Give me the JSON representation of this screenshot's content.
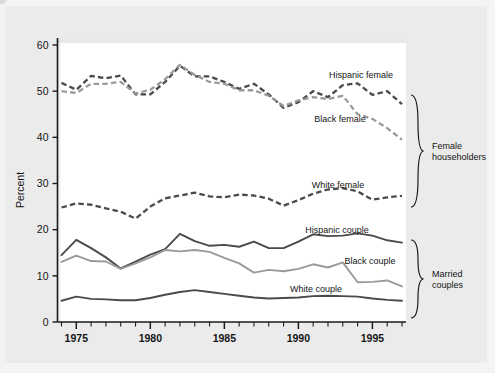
{
  "chart_data": {
    "type": "line",
    "title": "",
    "xlabel": "",
    "ylabel": "Percent",
    "xlim": [
      1974,
      1997
    ],
    "ylim": [
      0,
      62
    ],
    "yticks": [
      0,
      10,
      20,
      30,
      40,
      50,
      60
    ],
    "xticks": [
      1975,
      1980,
      1985,
      1990,
      1995
    ],
    "xtick_labels": [
      "1975",
      "1980",
      "1985",
      "1990",
      "1995"
    ],
    "ytick_labels": [
      "0",
      "10",
      "20",
      "30",
      "40",
      "50",
      "60"
    ],
    "minor_xticks_every": 1,
    "grid": false,
    "legend_position": "inline-annotations",
    "x": [
      1974,
      1975,
      1976,
      1977,
      1978,
      1979,
      1980,
      1981,
      1982,
      1983,
      1984,
      1985,
      1986,
      1987,
      1988,
      1989,
      1990,
      1991,
      1992,
      1993,
      1994,
      1995,
      1996,
      1997
    ],
    "series": [
      {
        "name": "Hispanic female",
        "style": "dashed",
        "color": "#4a4a4a",
        "values": [
          51.8,
          50.3,
          53.3,
          52.8,
          53.4,
          49.3,
          49.3,
          52.0,
          55.5,
          53.2,
          53.2,
          52.0,
          50.5,
          51.6,
          49.3,
          46.4,
          47.6,
          50.0,
          48.7,
          51.3,
          51.7,
          49.2,
          50.0,
          47.2
        ]
      },
      {
        "name": "Black female",
        "style": "dashed",
        "color": "#9a9a9a",
        "values": [
          50.0,
          49.6,
          51.6,
          51.6,
          52.0,
          49.5,
          50.3,
          52.6,
          55.7,
          53.5,
          52.0,
          51.6,
          50.2,
          50.2,
          49.0,
          46.8,
          48.0,
          48.7,
          48.3,
          49.0,
          45.0,
          44.0,
          42.0,
          39.5
        ]
      },
      {
        "name": "White female",
        "style": "dashed",
        "color": "#4a4a4a",
        "values": [
          24.8,
          25.7,
          25.4,
          24.6,
          23.9,
          22.4,
          25.0,
          26.8,
          27.4,
          28.0,
          27.2,
          27.0,
          27.6,
          27.4,
          26.7,
          25.2,
          26.4,
          27.8,
          28.7,
          29.0,
          28.3,
          26.5,
          27.0,
          27.3
        ]
      },
      {
        "name": "Hispanic couple",
        "style": "solid",
        "color": "#4a4a4a",
        "values": [
          14.5,
          17.8,
          16.0,
          14.0,
          11.6,
          13.1,
          14.6,
          15.8,
          19.1,
          17.5,
          16.5,
          16.7,
          16.3,
          17.4,
          16.0,
          16.0,
          17.4,
          19.0,
          18.6,
          18.7,
          19.2,
          18.7,
          17.7,
          17.2
        ]
      },
      {
        "name": "Black couple",
        "style": "solid",
        "color": "#9a9a9a",
        "values": [
          13.0,
          14.4,
          13.2,
          13.1,
          11.5,
          12.7,
          14.0,
          15.6,
          15.3,
          15.6,
          15.2,
          13.9,
          12.7,
          10.7,
          11.3,
          11.0,
          11.5,
          12.5,
          11.8,
          12.9,
          8.6,
          8.7,
          9.0,
          7.7
        ]
      },
      {
        "name": "White couple",
        "style": "solid",
        "color": "#4a4a4a",
        "values": [
          4.6,
          5.5,
          5.0,
          4.9,
          4.7,
          4.7,
          5.2,
          5.9,
          6.5,
          6.9,
          6.5,
          6.1,
          5.7,
          5.3,
          5.1,
          5.2,
          5.3,
          5.6,
          5.7,
          5.6,
          5.5,
          5.1,
          4.8,
          4.6
        ]
      }
    ],
    "annotations": [
      {
        "text": "Hispanic female",
        "x": 361,
        "y": 78
      },
      {
        "text": "Black female",
        "x": 340,
        "y": 122
      },
      {
        "text": "White female",
        "x": 338,
        "y": 188
      },
      {
        "text": "Hispanic couple",
        "x": 337,
        "y": 233
      },
      {
        "text": "Black couple",
        "x": 370,
        "y": 264
      },
      {
        "text": "White couple",
        "x": 316,
        "y": 292
      }
    ],
    "group_brackets": [
      {
        "label_line1": "Female",
        "label_line2": "householders",
        "y_top": 95,
        "y_bottom": 207
      },
      {
        "label_line1": "Married",
        "label_line2": "couples",
        "y_top": 240,
        "y_bottom": 318
      }
    ]
  }
}
